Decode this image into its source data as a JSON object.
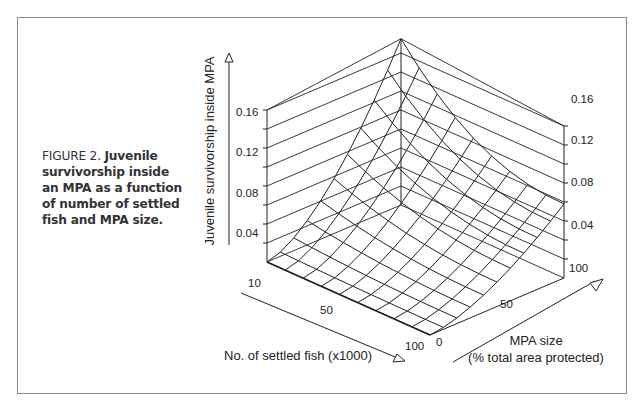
{
  "figure": {
    "label": "FIGURE 2.",
    "caption": "Juvenile survivorship inside an MPA as a function of number of settled fish and MPA size."
  },
  "chart_data": {
    "type": "surface3d",
    "title": "Juvenile survivorship inside an MPA as a function of number of settled fish and MPA size",
    "zlabel": "Juvenile survivorship inside MPA",
    "xlabel": "No. of settled fish (x1000)",
    "ylabel": "MPA size\n(% total area protected)",
    "xlabel_line1": "No. of settled fish (x1000)",
    "ylabel_line1": "MPA size",
    "ylabel_line2": "(% total area protected)",
    "z_ticks": [
      "0.04",
      "0.08",
      "0.12",
      "0.16"
    ],
    "x_ticks": [
      "10",
      "50",
      "100"
    ],
    "y_ticks": [
      "0",
      "50",
      "100"
    ],
    "xlim": [
      10,
      100
    ],
    "ylim": [
      0,
      100
    ],
    "zlim": [
      0,
      0.16
    ],
    "grid": true,
    "x": [
      10,
      20,
      30,
      40,
      50,
      60,
      70,
      80,
      90,
      100
    ],
    "y": [
      0,
      10,
      20,
      30,
      40,
      50,
      60,
      70,
      80,
      90,
      100
    ],
    "corner_values": {
      "fish10_mpa0": 0.0,
      "fish10_mpa100": 0.175,
      "fish100_mpa0": 0.0,
      "fish100_mpa100": 0.078
    }
  }
}
